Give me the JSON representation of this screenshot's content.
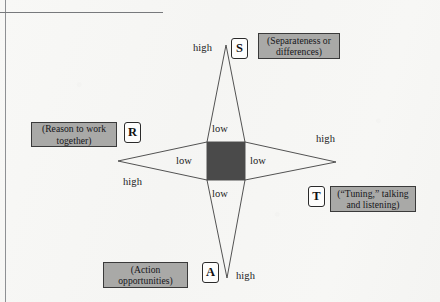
{
  "figure": {
    "type": "diagram",
    "colors": {
      "page_background": "#f7f7f5",
      "center_square": "#4a4a4a",
      "caption_box_fill": "#a9a9a7",
      "caption_box_border": "#3a3a3a",
      "letter_box_fill": "#fdfdfc",
      "letter_box_border": "#2a2a2a",
      "line_stroke": "#3f3f3f",
      "rule_stroke": "#8e9093"
    },
    "center": {
      "x": 226,
      "y": 161,
      "square_size": 38
    },
    "points": [
      {
        "key": "S",
        "letter": "S",
        "caption": "(Separateness or differences)",
        "caption_lines": [
          "(Separateness or",
          "differences)"
        ],
        "direction": "top",
        "outer_label": "high",
        "inner_label": "low",
        "vertex": {
          "x": 226,
          "y": 45
        }
      },
      {
        "key": "T",
        "letter": "T",
        "caption": "(“Tuning,” talking and listening)",
        "caption_lines": [
          "(“Tuning,” talking",
          "and listening)"
        ],
        "direction": "right",
        "outer_label": "high",
        "inner_label": "low",
        "vertex": {
          "x": 336,
          "y": 162
        }
      },
      {
        "key": "A",
        "letter": "A",
        "caption": "(Action opportunities)",
        "caption_lines": [
          "(Action",
          "opportunities)"
        ],
        "direction": "bottom",
        "outer_label": "high",
        "inner_label": "low",
        "vertex": {
          "x": 227,
          "y": 278
        }
      },
      {
        "key": "R",
        "letter": "R",
        "caption": "(Reason to work together)",
        "caption_lines": [
          "(Reason to work",
          "together)"
        ],
        "direction": "left",
        "outer_label": "high",
        "inner_label": "low",
        "vertex": {
          "x": 118,
          "y": 161
        }
      }
    ]
  }
}
